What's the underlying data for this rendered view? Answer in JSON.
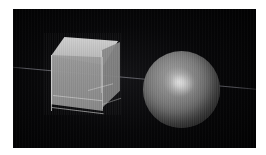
{
  "image": {
    "title": "3D rendered scene",
    "caption": "",
    "border_color": "#ffffff",
    "background_color": "#050506"
  },
  "scene": {
    "type": "raytraced-render",
    "background": "dark",
    "horizon": {
      "name": "ground-horizon-line",
      "color": "#9a9aa4",
      "description": "faint diagonal ground line"
    },
    "objects": [
      {
        "name": "cube",
        "label": "translucent cube",
        "material": "frosted glass",
        "color": "#9d9d9d",
        "position": "left",
        "faces": [
          "front",
          "top",
          "right"
        ]
      },
      {
        "name": "sphere",
        "label": "shaded sphere",
        "material": "glossy gray",
        "color": "#848484",
        "highlight_color": "#ffffff",
        "position": "right"
      }
    ]
  }
}
